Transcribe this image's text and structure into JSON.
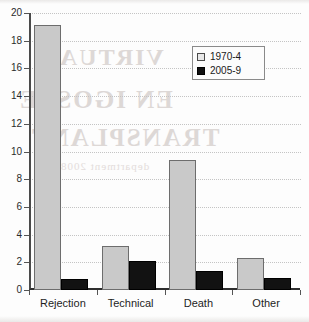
{
  "chart_data": {
    "type": "bar",
    "title": "",
    "subtitle": "",
    "xlabel": "",
    "ylabel": "",
    "categories": [
      "Rejection",
      "Technical",
      "Death",
      "Other"
    ],
    "series": [
      {
        "name": "1970-4",
        "color": "#c9c9c9",
        "values": [
          19.1,
          3.2,
          9.4,
          2.3
        ]
      },
      {
        "name": "2005-9",
        "color": "#121212",
        "values": [
          0.8,
          2.1,
          1.35,
          0.9
        ]
      }
    ],
    "ylim": [
      0,
      20
    ],
    "ytick_step": 2,
    "yticks": [
      0,
      2,
      4,
      6,
      8,
      10,
      12,
      14,
      16,
      18,
      20
    ],
    "ytick_labels": [
      "0",
      "2",
      "4",
      "6",
      "8",
      "10",
      "12",
      "14",
      "16",
      "18",
      "20"
    ],
    "grid": true,
    "grid_style": "dotted",
    "grid_axis": "y",
    "legend_position": "top-right",
    "annotations": []
  },
  "legend": {
    "entries": [
      {
        "label": "1970-4",
        "swatch": "legend-swatch-1970-4"
      },
      {
        "label": "2005-9",
        "swatch": "legend-swatch-2005-9"
      }
    ]
  },
  "scan_bleed": {
    "line1": "VIRTUAL",
    "line2": "EN IGOSTE",
    "line3": "TRANSPLANT",
    "line4": "department 2008"
  }
}
